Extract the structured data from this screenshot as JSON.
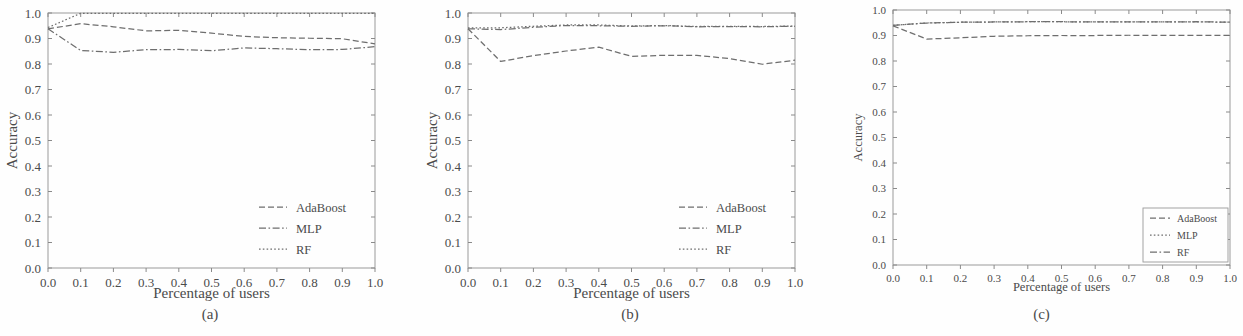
{
  "figure": {
    "panels": [
      {
        "id": "a",
        "caption": "(a)",
        "xlabel": "Percentage of users",
        "ylabel": "Accuracy",
        "legend_position": "lower right",
        "legend_frame": false
      },
      {
        "id": "b",
        "caption": "(b)",
        "xlabel": "Percentage of users",
        "ylabel": "Accuracy",
        "legend_position": "lower right",
        "legend_frame": false
      },
      {
        "id": "c",
        "caption": "(c)",
        "xlabel": "Percentage of users",
        "ylabel": "Accuracy",
        "legend_position": "lower right",
        "legend_frame": true
      }
    ],
    "xticks": [
      "0.0",
      "0.1",
      "0.2",
      "0.3",
      "0.4",
      "0.5",
      "0.6",
      "0.7",
      "0.8",
      "0.9",
      "1.0"
    ],
    "yticks": [
      "0.0",
      "0.1",
      "0.2",
      "0.3",
      "0.4",
      "0.5",
      "0.6",
      "0.7",
      "0.8",
      "0.9",
      "1.0"
    ],
    "legend_entries": [
      "AdaBoost",
      "MLP",
      "RF"
    ],
    "line_color": "#6e6e6e"
  },
  "chart_data": [
    {
      "type": "line",
      "panel": "a",
      "title": "(a)",
      "xlabel": "Percentage of users",
      "ylabel": "Accuracy",
      "xlim": [
        0.0,
        1.0
      ],
      "ylim": [
        0.0,
        1.0
      ],
      "xticks": [
        0.0,
        0.1,
        0.2,
        0.3,
        0.4,
        0.5,
        0.6,
        0.7,
        0.8,
        0.9,
        1.0
      ],
      "yticks": [
        0.0,
        0.1,
        0.2,
        0.3,
        0.4,
        0.5,
        0.6,
        0.7,
        0.8,
        0.9,
        1.0
      ],
      "grid": false,
      "legend": [
        "AdaBoost",
        "MLP",
        "RF"
      ],
      "legend_position": "lower right",
      "x": [
        0.0,
        0.1,
        0.2,
        0.3,
        0.4,
        0.5,
        0.6,
        0.7,
        0.8,
        0.9,
        1.0
      ],
      "series": [
        {
          "name": "AdaBoost",
          "dash": "dashed",
          "values": [
            0.938,
            0.958,
            0.946,
            0.93,
            0.932,
            0.921,
            0.908,
            0.903,
            0.901,
            0.899,
            0.879
          ]
        },
        {
          "name": "MLP",
          "dash": "dashdot",
          "values": [
            0.938,
            0.853,
            0.846,
            0.856,
            0.857,
            0.852,
            0.863,
            0.86,
            0.856,
            0.857,
            0.868
          ]
        },
        {
          "name": "RF",
          "dash": "dotted",
          "values": [
            0.943,
            0.999,
            0.999,
            0.999,
            0.999,
            0.999,
            0.999,
            0.999,
            0.999,
            0.999,
            0.999
          ]
        }
      ]
    },
    {
      "type": "line",
      "panel": "b",
      "title": "(b)",
      "xlabel": "Percentage of users",
      "ylabel": "Accuracy",
      "xlim": [
        0.0,
        1.0
      ],
      "ylim": [
        0.0,
        1.0
      ],
      "xticks": [
        0.0,
        0.1,
        0.2,
        0.3,
        0.4,
        0.5,
        0.6,
        0.7,
        0.8,
        0.9,
        1.0
      ],
      "yticks": [
        0.0,
        0.1,
        0.2,
        0.3,
        0.4,
        0.5,
        0.6,
        0.7,
        0.8,
        0.9,
        1.0
      ],
      "grid": false,
      "legend": [
        "AdaBoost",
        "MLP",
        "RF"
      ],
      "legend_position": "lower right",
      "x": [
        0.0,
        0.1,
        0.2,
        0.3,
        0.4,
        0.5,
        0.6,
        0.7,
        0.8,
        0.9,
        1.0
      ],
      "series": [
        {
          "name": "AdaBoost",
          "dash": "dashed",
          "values": [
            0.938,
            0.81,
            0.833,
            0.851,
            0.866,
            0.83,
            0.834,
            0.834,
            0.821,
            0.799,
            0.815
          ]
        },
        {
          "name": "MLP",
          "dash": "dashdot",
          "values": [
            0.938,
            0.935,
            0.944,
            0.951,
            0.95,
            0.948,
            0.95,
            0.946,
            0.947,
            0.946,
            0.948
          ]
        },
        {
          "name": "RF",
          "dash": "dotted",
          "values": [
            0.942,
            0.942,
            0.948,
            0.953,
            0.953,
            0.949,
            0.951,
            0.947,
            0.948,
            0.947,
            0.949
          ]
        }
      ]
    },
    {
      "type": "line",
      "panel": "c",
      "title": "(c)",
      "xlabel": "Percentage of users",
      "ylabel": "Accuracy",
      "xlim": [
        0.0,
        1.0
      ],
      "ylim": [
        0.0,
        1.0
      ],
      "xticks": [
        0.0,
        0.1,
        0.2,
        0.3,
        0.4,
        0.5,
        0.6,
        0.7,
        0.8,
        0.9,
        1.0
      ],
      "yticks": [
        0.0,
        0.1,
        0.2,
        0.3,
        0.4,
        0.5,
        0.6,
        0.7,
        0.8,
        0.9,
        1.0
      ],
      "grid": false,
      "legend": [
        "AdaBoost",
        "MLP",
        "RF"
      ],
      "legend_position": "lower right",
      "x": [
        0.0,
        0.1,
        0.2,
        0.3,
        0.4,
        0.5,
        0.6,
        0.7,
        0.8,
        0.9,
        1.0
      ],
      "series": [
        {
          "name": "AdaBoost",
          "dash": "dashed",
          "values": [
            0.938,
            0.886,
            0.891,
            0.897,
            0.899,
            0.9,
            0.9,
            0.901,
            0.901,
            0.901,
            0.901
          ]
        },
        {
          "name": "MLP",
          "dash": "dotted",
          "values": [
            0.94,
            0.949,
            0.952,
            0.953,
            0.954,
            0.954,
            0.953,
            0.953,
            0.953,
            0.954,
            0.952
          ]
        },
        {
          "name": "RF",
          "dash": "dashdot",
          "values": [
            0.94,
            0.949,
            0.952,
            0.953,
            0.954,
            0.954,
            0.953,
            0.953,
            0.953,
            0.954,
            0.952
          ]
        }
      ]
    }
  ]
}
